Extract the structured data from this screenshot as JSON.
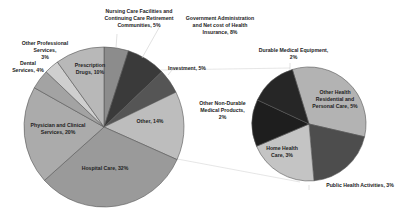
{
  "chart_data": [
    {
      "type": "pie",
      "title": "",
      "name": "main-pie",
      "center": [
        104,
        127
      ],
      "radius": 80,
      "start_angle_deg": 0,
      "slices": [
        {
          "label": "Nursing Care Facilities and Continuing Care Retirement Communities, 5%",
          "value": 5,
          "color": "#8c8c8c"
        },
        {
          "label": "Government Administration and Net cost of Health Insurance, 8%",
          "value": 8,
          "color": "#3a3a3a"
        },
        {
          "label": "Investment, 5%",
          "value": 5,
          "color": "#555555"
        },
        {
          "label": "Other, 14%",
          "value": 14,
          "color": "#bdbdbd"
        },
        {
          "label": "Hospital Care, 32%",
          "value": 32,
          "color": "#9a9a9a"
        },
        {
          "label": "Physician and Clinical Services, 20%",
          "value": 20,
          "color": "#ababab"
        },
        {
          "label": "Dental Services, 4%",
          "value": 4,
          "color": "#a3a3a3"
        },
        {
          "label": "Other Professional Services, 3%",
          "value": 3,
          "color": "#cfcfcf"
        },
        {
          "label": "Prescription Drugs, 10%",
          "value": 10,
          "color": "#b8b8b8"
        }
      ]
    },
    {
      "type": "pie",
      "title": "",
      "name": "breakout-pie",
      "center": [
        309,
        124
      ],
      "radius": 57,
      "start_angle_deg": -17,
      "slices": [
        {
          "label": "Other Health Residential and Personal Care, 5%",
          "value": 5,
          "color": "#b3b3b3"
        },
        {
          "label": "Public Health Activities, 3%",
          "value": 3,
          "color": "#4d4d4d"
        },
        {
          "label": "Home Health Care, 3%",
          "value": 3,
          "color": "#c4c4c4"
        },
        {
          "label": "Other Non-Durable Medical Products, 2%",
          "value": 2,
          "color": "#1e1e1e"
        },
        {
          "label": "Durable Medical Equipment, 2%",
          "value": 2,
          "color": "#262626"
        }
      ]
    }
  ],
  "labels": {
    "nursing": "Nursing Care Facilities and\nContinuing Care Retirement\nCommunities, 5%",
    "government": "Government Administration\nand Net cost of Health\nInsurance, 8%",
    "investment": "Investment, 5%",
    "other": "Other, 14%",
    "hospital": "Hospital Care, 32%",
    "physician": "Physician and Clinical\nServices, 20%",
    "dental": "Dental\nServices, 4%",
    "other_prof": "Other Professional Services,\n3%",
    "prescription": "Prescription\nDrugs, 10%",
    "durable": "Durable Medical Equipment,\n2%",
    "other_health": "Other Health\nResidential and\nPersonal Care, 5%",
    "other_nondurable": "Other Non-Durable\nMedical Products,\n2%",
    "home_health": "Home Health\nCare, 3%",
    "public_health": "Public Health Activities, 3%"
  }
}
